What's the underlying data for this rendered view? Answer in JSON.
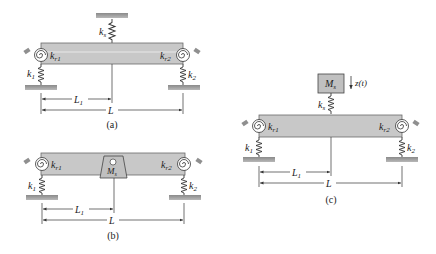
{
  "figure": {
    "colors": {
      "beam_fill": "#c8c8c8",
      "beam_stroke": "#6a6a6a",
      "ground_fill": "#9a9a9a",
      "line": "#333333",
      "support_pad": "#8f8f8f"
    }
  },
  "panels": [
    {
      "caption": "(a)",
      "labels": {
        "ks": "k",
        "ks_sub": "s",
        "kr1": "k",
        "kr1_sub": "r1",
        "kr2": "k",
        "kr2_sub": "r2",
        "k1": "k",
        "k1_sub": "1",
        "k2": "k",
        "k2_sub": "2",
        "L1": "L",
        "L1_sub": "1",
        "L": "L"
      }
    },
    {
      "caption": "(b)",
      "labels": {
        "Ms": "M",
        "Ms_sub": "s",
        "kr1": "k",
        "kr1_sub": "r1",
        "kr2": "k",
        "kr2_sub": "r2",
        "k1": "k",
        "k1_sub": "1",
        "k2": "k",
        "k2_sub": "2",
        "L1": "L",
        "L1_sub": "1",
        "L": "L"
      }
    },
    {
      "caption": "(c)",
      "labels": {
        "Ms": "M",
        "Ms_sub": "s",
        "z": "z(t)",
        "ks": "k",
        "ks_sub": "s",
        "kr1": "k",
        "kr1_sub": "r1",
        "kr2": "k",
        "kr2_sub": "r2",
        "k1": "k",
        "k1_sub": "1",
        "k2": "k",
        "k2_sub": "2",
        "L1": "L",
        "L1_sub": "1",
        "L": "L"
      }
    }
  ]
}
